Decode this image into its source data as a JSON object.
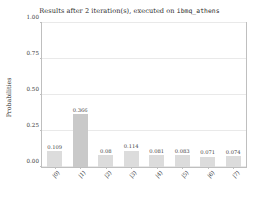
{
  "chart_data": {
    "type": "bar",
    "title": "Results after 2 iteration(s), executed on ",
    "title_backend": "ibmq_athens",
    "title_full": "Results after 2 iteration(s), executed on ibmq_athens",
    "xlabel": "",
    "ylabel": "Probabilities",
    "categories": [
      "|0⟩",
      "|1⟩",
      "|2⟩",
      "|3⟩",
      "|4⟩",
      "|5⟩",
      "|6⟩",
      "|7⟩"
    ],
    "values": [
      0.109,
      0.366,
      0.08,
      0.114,
      0.081,
      0.083,
      0.071,
      0.074
    ],
    "value_labels": [
      "0.109",
      "0.366",
      "0.08",
      "0.114",
      "0.081",
      "0.083",
      "0.071",
      "0.074"
    ],
    "ylim": [
      0.0,
      1.0
    ],
    "ytick_labels": [
      "0.00",
      "0.25",
      "0.50",
      "0.75",
      "1.00"
    ],
    "ytick_values": [
      0.0,
      0.25,
      0.5,
      0.75,
      1.0
    ],
    "grid": true,
    "legend": "none",
    "highlight_index": 1,
    "colors": {
      "bar": "#dcdcdc",
      "bar_highlight": "#c9c9c9",
      "grid": "#e9e9e9",
      "axis": "#bfbfbf",
      "text": "#3a3a3a",
      "background": "#ffffff"
    }
  }
}
